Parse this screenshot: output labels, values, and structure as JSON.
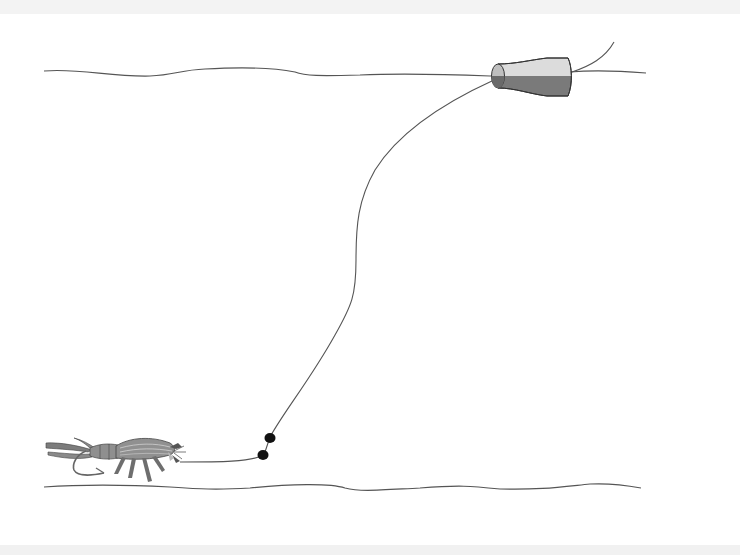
{
  "diagram": {
    "elements": [
      {
        "id": "water-surface",
        "kind": "line"
      },
      {
        "id": "float",
        "kind": "bobber"
      },
      {
        "id": "fishing-line",
        "kind": "line"
      },
      {
        "id": "split-shot-weights",
        "kind": "weights",
        "count": 2
      },
      {
        "id": "shrimp-fly",
        "kind": "lure"
      },
      {
        "id": "bottom",
        "kind": "line"
      }
    ],
    "colors": {
      "line": "#555555",
      "float_light": "#d9d9d9",
      "float_dark": "#777777",
      "weight": "#111111",
      "shrimp_body": "#8a8a8a",
      "shrimp_dark": "#5a5a5a",
      "band": "#f2f2f2"
    }
  }
}
